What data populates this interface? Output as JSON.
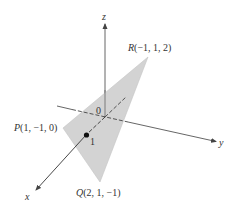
{
  "figure": {
    "type": "3d-triangle-diagram",
    "colors": {
      "background": "#ffffff",
      "triangle_fill": "#d3d3d3",
      "axis": "#444444",
      "text": "#333333"
    },
    "axes": {
      "x": {
        "label": "x"
      },
      "y": {
        "label": "y"
      },
      "z": {
        "label": "z"
      }
    },
    "origin_label": "0",
    "tick_label": "1",
    "points": {
      "P": {
        "letter": "P",
        "coords": "(1, −1, 0)"
      },
      "Q": {
        "letter": "Q",
        "coords": "(2, 1, −1)"
      },
      "R": {
        "letter": "R",
        "coords": "(−1, 1, 2)"
      }
    }
  }
}
